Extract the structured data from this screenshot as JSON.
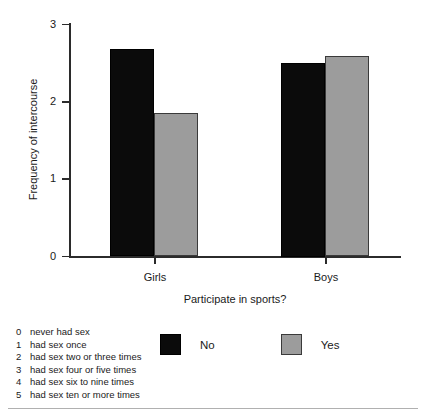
{
  "chart_data": {
    "type": "bar",
    "title": "",
    "xlabel": "Participate in sports?",
    "ylabel": "Frequency of intercourse",
    "categories": [
      "Girls",
      "Boys"
    ],
    "series": [
      {
        "name": "No",
        "color": "#0b0b0b",
        "values": [
          2.69,
          2.5
        ]
      },
      {
        "name": "Yes",
        "color": "#9c9c9c",
        "values": [
          1.85,
          2.59
        ]
      }
    ],
    "ylim": [
      0,
      3
    ],
    "yticks": [
      0,
      1,
      2,
      3
    ],
    "ytick_labels": [
      "0",
      "1",
      "2",
      "3"
    ],
    "grid": false,
    "legend_position": "bottom-center"
  },
  "legend": {
    "items": [
      {
        "label": "No",
        "swatch": "black-square-swatch"
      },
      {
        "label": "Yes",
        "swatch": "gray-square-swatch"
      }
    ]
  },
  "footnote": {
    "rows": [
      {
        "code": "0",
        "text": "never had sex"
      },
      {
        "code": "1",
        "text": "had sex once"
      },
      {
        "code": "2",
        "text": "had sex two or three times"
      },
      {
        "code": "3",
        "text": "had sex four or five times"
      },
      {
        "code": "4",
        "text": "had sex six to nine times"
      },
      {
        "code": "5",
        "text": "had sex ten or more times"
      }
    ]
  }
}
